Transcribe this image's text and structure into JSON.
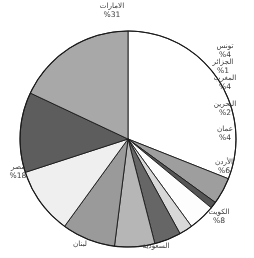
{
  "chart_data": {
    "type": "pie",
    "title": "",
    "subtitle": "",
    "xlabel": "",
    "ylabel": "",
    "legend_position": "none",
    "grid": false,
    "labels_outside": true,
    "start_angle_deg": -90,
    "direction": "clockwise",
    "categories": [
      "الامارات",
      "تونس",
      "الجزائر",
      "المغرب",
      "البحرين",
      "عمان",
      "الأردن",
      "الكويت",
      "السعودية",
      "لبنان",
      "مصر"
    ],
    "values": [
      31,
      4,
      1,
      4,
      2,
      4,
      6,
      8,
      10,
      12,
      18
    ],
    "value_labels": [
      "%31",
      "%4",
      "%1",
      "%4",
      "%2",
      "%4",
      "%6",
      "%8",
      "",
      "",
      "%18"
    ],
    "colors": [
      "#ffffff",
      "#9e9e9e",
      "#555555",
      "#fdfdfd",
      "#d8d8d8",
      "#666666",
      "#b6b6b6",
      "#9a9a9a",
      "#efefef",
      "#5d5d5d",
      "#a8a8a8"
    ],
    "slices": [
      {
        "name": "الامارات",
        "value": 31,
        "value_label": "%31",
        "color": "#ffffff"
      },
      {
        "name": "تونس",
        "value": 4,
        "value_label": "%4",
        "color": "#9e9e9e"
      },
      {
        "name": "الجزائر",
        "value": 1,
        "value_label": "%1",
        "color": "#555555"
      },
      {
        "name": "المغرب",
        "value": 4,
        "value_label": "%4",
        "color": "#fdfdfd"
      },
      {
        "name": "البحرين",
        "value": 2,
        "value_label": "%2",
        "color": "#d8d8d8"
      },
      {
        "name": "عمان",
        "value": 4,
        "value_label": "%4",
        "color": "#666666"
      },
      {
        "name": "الأردن",
        "value": 6,
        "value_label": "%6",
        "color": "#b6b6b6"
      },
      {
        "name": "الكويت",
        "value": 8,
        "value_label": "%8",
        "color": "#9a9a9a"
      },
      {
        "name": "السعودية",
        "value": 10,
        "value_label": "",
        "color": "#efefef"
      },
      {
        "name": "لبنان",
        "value": 12,
        "value_label": "",
        "color": "#5d5d5d"
      },
      {
        "name": "مصر",
        "value": 18,
        "value_label": "%18",
        "color": "#a8a8a8"
      }
    ]
  },
  "labels": {
    "emirates": {
      "name": "الامارات",
      "value": "%31"
    },
    "tunisia": {
      "name": "تونس",
      "value": "%4"
    },
    "algeria": {
      "name": "الجزائر",
      "value": "%1"
    },
    "morocco": {
      "name": "المغرب",
      "value": "%4"
    },
    "bahrain": {
      "name": "البحرين",
      "value": "%2"
    },
    "oman": {
      "name": "عمان",
      "value": "%4"
    },
    "jordan": {
      "name": "الأردن",
      "value": "%6"
    },
    "kuwait": {
      "name": "الكويت",
      "value": "%8"
    },
    "saudi": {
      "name": "السعودية",
      "value": ""
    },
    "lebanon": {
      "name": "لبنان",
      "value": ""
    },
    "egypt": {
      "name": "مصر",
      "value": "%18"
    }
  },
  "geometry": {
    "center_x": 128,
    "center_y": 139,
    "radius": 108
  }
}
